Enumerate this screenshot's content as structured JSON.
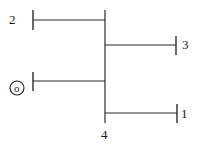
{
  "diagram": {
    "type": "one-line power system diagram",
    "main_bus": {
      "label": "4"
    },
    "buses": [
      {
        "id": "bus-2",
        "label": "2",
        "side": "left",
        "position": "top"
      },
      {
        "id": "bus-3",
        "label": "3",
        "side": "right",
        "position": "upper-middle"
      },
      {
        "id": "bus-gen",
        "label": "o",
        "side": "left",
        "position": "lower-middle",
        "symbol": "generator-circle"
      },
      {
        "id": "bus-1",
        "label": "1",
        "side": "right",
        "position": "bottom"
      }
    ],
    "colors": {
      "line": "#2a2a2a",
      "text": "#1a1a1a",
      "background": "#ffffff"
    }
  }
}
